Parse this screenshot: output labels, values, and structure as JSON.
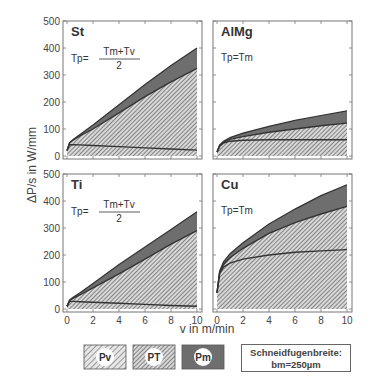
{
  "chart_data": {
    "type": "area",
    "title": "",
    "xlabel": "v in m/min",
    "ylabel": "ΔP/s in W/mm",
    "xlim": [
      0,
      10
    ],
    "ylim": [
      0,
      500
    ],
    "x_ticks": [
      0,
      2,
      4,
      6,
      8,
      10
    ],
    "y_ticks": [
      0,
      100,
      200,
      300,
      400,
      500
    ],
    "layout": "2x2 panels, shared axes",
    "legend": [
      {
        "key": "Pv",
        "label": "Pv",
        "style": "sparse diagonal hatching"
      },
      {
        "key": "PT",
        "label": "PT",
        "style": "dense diagonal hatching"
      },
      {
        "key": "Pm",
        "label": "Pm",
        "style": "solid dark gray"
      }
    ],
    "annotation": {
      "line1": "Schneidfugenbreite:",
      "line2": "bm=250µm"
    },
    "panels": [
      {
        "material": "St",
        "formula": {
          "lhs": "Tp=",
          "numerator": "Tm+Tv",
          "denominator": "2"
        },
        "x": [
          0,
          0.2,
          0.5,
          1,
          2,
          4,
          6,
          8,
          10
        ],
        "series": [
          {
            "name": "Pv (lower line)",
            "values": [
              20,
              42,
              42,
              41,
              39,
              35,
              30,
              26,
              22
            ]
          },
          {
            "name": "Pv+PT (middle line)",
            "values": [
              20,
              48,
              60,
              75,
              100,
              160,
              220,
              275,
              325
            ]
          },
          {
            "name": "Total Pv+PT+Pm (top line)",
            "values": [
              20,
              50,
              62,
              80,
              115,
              190,
              265,
              335,
              400
            ]
          }
        ]
      },
      {
        "material": "AlMg",
        "formula": {
          "lhs": "Tp=Tm"
        },
        "x": [
          0,
          0.2,
          0.5,
          1,
          2,
          4,
          6,
          8,
          10
        ],
        "series": [
          {
            "name": "Pv (lower line)",
            "values": [
              15,
              35,
              48,
              55,
              58,
              60,
              60,
              60,
              60
            ]
          },
          {
            "name": "Pv+PT (middle line)",
            "values": [
              15,
              38,
              52,
              62,
              72,
              88,
              100,
              112,
              122
            ]
          },
          {
            "name": "Total Pv+PT+Pm (top line)",
            "values": [
              15,
              40,
              55,
              68,
              85,
              110,
              132,
              150,
              167
            ]
          }
        ]
      },
      {
        "material": "Ti",
        "formula": {
          "lhs": "Tp=",
          "numerator": "Tm+Tv",
          "denominator": "2"
        },
        "x": [
          0,
          0.2,
          0.5,
          1,
          2,
          4,
          6,
          8,
          10
        ],
        "series": [
          {
            "name": "Pv (lower line)",
            "values": [
              10,
              28,
              28,
              27,
              25,
              21,
              17,
              13,
              10
            ]
          },
          {
            "name": "Pv+PT (middle line)",
            "values": [
              10,
              32,
              40,
              52,
              78,
              130,
              185,
              240,
              290
            ]
          },
          {
            "name": "Total Pv+PT+Pm (top line)",
            "values": [
              10,
              34,
              44,
              60,
              95,
              165,
              230,
              295,
              360
            ]
          }
        ]
      },
      {
        "material": "Cu",
        "formula": {
          "lhs": "Tp=Tm"
        },
        "x": [
          0,
          0.2,
          0.5,
          1,
          2,
          4,
          6,
          8,
          10
        ],
        "series": [
          {
            "name": "Pv (lower line)",
            "values": [
              60,
              130,
              155,
              170,
              185,
              200,
              210,
              215,
              220
            ]
          },
          {
            "name": "Pv+PT (middle line)",
            "values": [
              60,
              135,
              165,
              190,
              225,
              280,
              320,
              352,
              380
            ]
          },
          {
            "name": "Total Pv+PT+Pm (top line)",
            "values": [
              60,
              140,
              175,
              205,
              245,
              315,
              370,
              420,
              460
            ]
          }
        ]
      }
    ]
  },
  "axes": {
    "xlabel": "v in m/min",
    "ylabel": "ΔP/s in W/mm"
  },
  "legend": {
    "items": [
      {
        "label": "Pv"
      },
      {
        "label": "PT"
      },
      {
        "label": "Pm"
      }
    ],
    "note_line1": "Schneidfugenbreite:",
    "note_line2": "bm=250µm"
  },
  "colors": {
    "pm_fill": "#6e6e6e",
    "hatch_line": "#555555",
    "curve": "#333333",
    "frame": "#777777"
  }
}
